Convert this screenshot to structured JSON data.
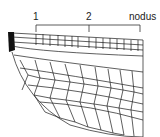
{
  "diagram": {
    "labels": [
      {
        "id": "1",
        "text": "1"
      },
      {
        "id": "2",
        "text": "2"
      },
      {
        "id": "nodus",
        "text": "nodus"
      }
    ],
    "colors": {
      "vein": "#1a1a1a",
      "background": "#ffffff"
    }
  }
}
